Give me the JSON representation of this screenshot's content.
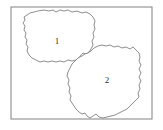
{
  "figure": {
    "background_color": "#ffffff",
    "width": 163,
    "height": 130
  },
  "frame": {
    "name": "bounding-frame",
    "stroke_color": "#8d8d8d",
    "fill_color": "#ffffff",
    "x": 11,
    "y": 7,
    "width": 141,
    "height": 112
  },
  "regions": [
    {
      "id": "region-1",
      "label": "1",
      "label_x": 57,
      "label_y": 42,
      "stroke_color": "#7a7a7a",
      "fill_color": "#ffffff",
      "path": "M 38 11 L 44 10 L 49 11 L 53 10 L 56 12 L 60 10 L 64 11 L 68 10 L 72 12 L 77 11 L 82 13 L 86 12 L 90 14 L 93 17 L 95 21 L 94 25 L 95 29 L 93 33 L 94 37 L 92 41 L 93 45 L 91 49 L 89 52 L 86 54 L 83 53 L 81 55 L 79 58 L 76 60 L 72 61 L 68 60 L 64 62 L 60 61 L 56 62 L 52 61 L 48 62 L 44 61 L 40 62 L 36 60 L 32 58 L 29 55 L 27 51 L 28 47 L 26 44 L 27 40 L 25 37 L 26 33 L 24 30 L 25 26 L 23 23 L 25 20 L 24 17 L 27 15 L 30 13 L 34 12 Z"
    },
    {
      "id": "region-2",
      "label": "2",
      "label_x": 107,
      "label_y": 81,
      "stroke_color": "#7a7a7a",
      "fill_color": "#ffffff",
      "path": "M 88 53 L 91 51 L 94 48 L 98 46 L 102 45 L 106 46 L 110 45 L 114 47 L 118 46 L 122 48 L 126 47 L 130 49 L 133 47 L 136 50 L 139 53 L 140 57 L 139 61 L 141 65 L 139 69 L 141 73 L 139 77 L 141 81 L 139 85 L 140 89 L 138 93 L 139 97 L 136 100 L 133 103 L 130 106 L 127 109 L 123 111 L 119 113 L 115 115 L 111 116 L 107 117 L 103 118 L 99 117 L 96 114 L 93 116 L 90 118 L 87 116 L 85 113 L 82 114 L 79 112 L 76 109 L 74 106 L 72 103 L 70 100 L 71 96 L 69 92 L 70 88 L 68 84 L 69 80 L 67 76 L 68 72 L 70 68 L 72 64 L 75 61 L 78 58 L 82 56 L 85 54 Z"
    }
  ]
}
